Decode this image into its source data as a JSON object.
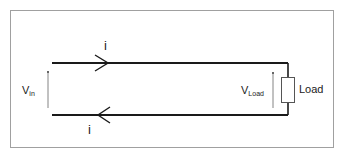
{
  "diagram": {
    "type": "transmission-line circuit",
    "labels": {
      "current_top": "i",
      "current_bottom": "i",
      "vin_main": "V",
      "vin_sub": "in",
      "vload_main": "V",
      "vload_sub": "Load",
      "load": "Load"
    },
    "colors": {
      "wire": "#1a1a1a",
      "border": "#9a9a9a",
      "text": "#222222"
    }
  }
}
